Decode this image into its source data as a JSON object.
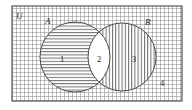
{
  "diagram": {
    "type": "venn-two-set",
    "title_visible": false,
    "universe": {
      "label": "U",
      "name": "universal-set",
      "fill_pattern": "crosshatch-grid",
      "frame_color": "#555555"
    },
    "sets": [
      {
        "key": "A",
        "label": "A",
        "fill_pattern": "horizontal-lines",
        "label_x": 48,
        "label_y": 23,
        "cx": 75,
        "cy": 57,
        "r": 35
      },
      {
        "key": "B",
        "label": "B",
        "fill_pattern": "vertical-lines",
        "label_x": 148,
        "label_y": 24,
        "cx": 122,
        "cy": 57,
        "r": 34
      }
    ],
    "regions": [
      {
        "id": "region-1",
        "label": "1",
        "meaning": "A-only",
        "fill_pattern": "horizontal-lines",
        "x": 62,
        "y": 60
      },
      {
        "id": "region-2",
        "label": "2",
        "meaning": "A-intersect-B",
        "fill_pattern": "none",
        "x": 99,
        "y": 60
      },
      {
        "id": "region-3",
        "label": "3",
        "meaning": "B-only",
        "fill_pattern": "vertical-lines",
        "x": 134,
        "y": 60
      },
      {
        "id": "region-4",
        "label": "4",
        "meaning": "outside-both",
        "fill_pattern": "crosshatch-grid",
        "x": 162,
        "y": 83
      }
    ],
    "colors": {
      "line": "#4a4a4a",
      "hatch": "#6e6e6e",
      "grid": "#8a8a8a",
      "background": "#ffffff",
      "white_fill": "#ffffff"
    },
    "frame": {
      "x": 12,
      "y": 6,
      "width": 170,
      "height": 95
    }
  }
}
